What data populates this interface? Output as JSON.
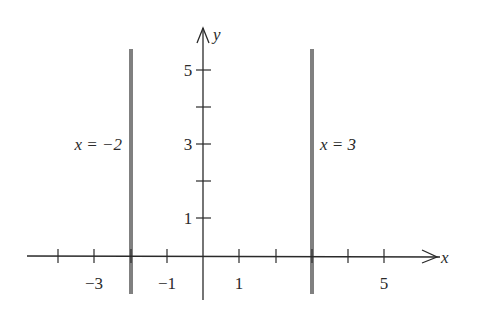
{
  "diagram": {
    "axes": {
      "x_label": "x",
      "y_label": "y",
      "x_tick_labels": [
        {
          "value": -3,
          "text": "−3"
        },
        {
          "value": -1,
          "text": "−1"
        },
        {
          "value": 1,
          "text": "1"
        },
        {
          "value": 5,
          "text": "5"
        }
      ],
      "y_tick_labels": [
        {
          "value": 1,
          "text": "1"
        },
        {
          "value": 3,
          "text": "3"
        },
        {
          "value": 5,
          "text": "5"
        }
      ],
      "x_ticks": [
        -4,
        -3,
        -2,
        -1,
        1,
        2,
        3,
        4,
        5
      ],
      "y_ticks": [
        1,
        2,
        3,
        4,
        5
      ]
    },
    "vertical_lines": [
      {
        "x": -2,
        "label": "x = −2"
      },
      {
        "x": 3,
        "label": "x = 3"
      }
    ],
    "colors": {
      "axis": "#2a2a2a",
      "vertical_line": "#808080"
    }
  }
}
